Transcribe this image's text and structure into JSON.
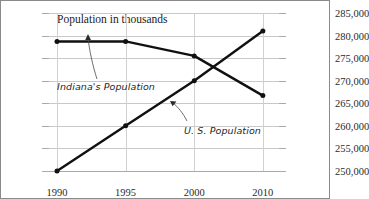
{
  "chart_data": {
    "type": "line",
    "title": "Population in thousands",
    "xlabel": "",
    "ylabel": "Population in thousands",
    "ylabel_right": "",
    "categories": [
      "1990",
      "1995",
      "2000",
      "2010"
    ],
    "x": [
      1990,
      1995,
      2000,
      2010
    ],
    "ylim": [
      5250,
      5600
    ],
    "ylim_right": [
      250000,
      285000
    ],
    "ytick_step": 50,
    "ytick_step_right": 5000,
    "yticks": [
      "5,600",
      "5,550",
      "5,500",
      "5,450",
      "5,400",
      "5,350",
      "5,300",
      "5,250"
    ],
    "yticks_right": [
      "285,000",
      "280,000",
      "275,000",
      "270,000",
      "265,000",
      "260,000",
      "255,000",
      "250,000"
    ],
    "ytick_values": [
      5600,
      5550,
      5500,
      5450,
      5400,
      5350,
      5300,
      5250
    ],
    "ytick_values_right": [
      285000,
      280000,
      275000,
      270000,
      265000,
      260000,
      255000,
      250000
    ],
    "grid": true,
    "legend_position": "inline-annotations",
    "series": [
      {
        "name": "Indiana's Population",
        "axis": "left",
        "units": "thousands",
        "values": [
          5537,
          5537,
          5505,
          5417
        ],
        "color": "#111111",
        "marker": "circle"
      },
      {
        "name": "U. S. Population",
        "axis": "right",
        "units": "people",
        "values": [
          250000,
          260000,
          270000,
          281000
        ],
        "color": "#111111",
        "marker": "circle"
      }
    ],
    "annotations": [
      {
        "text": "Indiana's Population",
        "points_to_series": "Indiana's Population"
      },
      {
        "text": "U. S. Population",
        "points_to_series": "U. S. Population"
      }
    ]
  },
  "labels": {
    "title": "Population in thousands",
    "annotation_indiana": "Indiana's Population",
    "annotation_us": "U. S. Population",
    "x": [
      "1990",
      "1995",
      "2000",
      "2010"
    ],
    "y_left": [
      "5,600",
      "5,550",
      "5,500",
      "5,450",
      "5,400",
      "5,350",
      "5,300",
      "5,250"
    ],
    "y_right": [
      "285,000",
      "280,000",
      "275,000",
      "270,000",
      "265,000",
      "260,000",
      "255,000",
      "250,000"
    ]
  },
  "colors": {
    "series": "#111111",
    "grid": "#c8c8c8",
    "axis": "#a9a9a9",
    "border": "#8a8a8a",
    "text": "#1a1a1a",
    "background": "#ffffff"
  }
}
